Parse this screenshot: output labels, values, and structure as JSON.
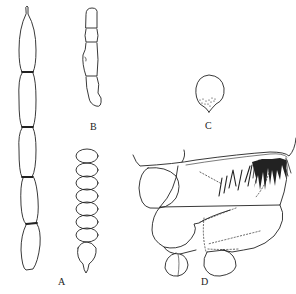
{
  "figure": {
    "panels": [
      {
        "id": "A",
        "label": "A",
        "description": "segmented filament and beaded chain"
      },
      {
        "id": "B",
        "label": "B",
        "description": "short segmented appendage"
      },
      {
        "id": "C",
        "label": "C",
        "description": "ovoid body with stippling"
      },
      {
        "id": "D",
        "label": "D",
        "description": "lateral view with bristle tuft"
      }
    ]
  },
  "colors": {
    "ink": "#222222",
    "background": "#ffffff"
  }
}
